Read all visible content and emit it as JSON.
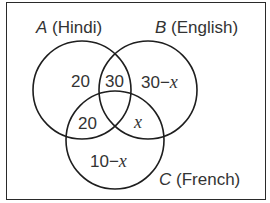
{
  "diagram": {
    "type": "venn",
    "sets": [
      {
        "letter": "A",
        "name": "(Hindi)"
      },
      {
        "letter": "B",
        "name": "(English)"
      },
      {
        "letter": "C",
        "name": "(French)"
      }
    ],
    "regions": {
      "a_only": "20",
      "a_and_b": "30",
      "b_only_num": "30",
      "b_only_op": "−",
      "b_only_var": "x",
      "a_and_c": "20",
      "b_and_c_var": "x",
      "c_only_num": "10",
      "c_only_op": "−",
      "c_only_var": "x"
    },
    "stroke_color": "#1e1e1e"
  }
}
